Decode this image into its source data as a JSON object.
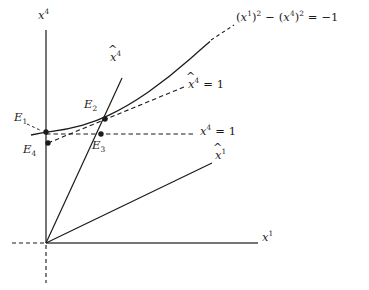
{
  "figure": {
    "type": "minkowski-spacetime-diagram",
    "background": "#ffffff",
    "ink_color": "#1b1b1b",
    "width": 369,
    "height": 290
  },
  "axes": {
    "vertical_label": "x",
    "vertical_superscript": "4",
    "horizontal_label": "x",
    "horizontal_superscript": "1",
    "origin": {
      "x": 46,
      "y": 243
    },
    "vertical_axis": {
      "x": 46,
      "y_top": 30,
      "y_bottom": 243
    },
    "horizontal_axis": {
      "y": 243,
      "x_left": 46,
      "x_right": 258
    },
    "dashed_extension_left": {
      "from_x": 12,
      "to_x": 46,
      "y": 243
    },
    "dashed_extension_down": {
      "x": 46,
      "from_y": 243,
      "to_y": 283
    }
  },
  "boosted_axes": {
    "x4_hat": {
      "label_base": "x",
      "label_superscript": "4",
      "label_accent": "hat",
      "line_from": {
        "x": 46,
        "y": 243
      },
      "line_to": {
        "x": 122,
        "y": 78
      }
    },
    "x1_hat": {
      "label_base": "x",
      "label_superscript": "1",
      "label_accent": "hat",
      "line_from": {
        "x": 46,
        "y": 243
      },
      "line_to": {
        "x": 212,
        "y": 163
      }
    }
  },
  "curve": {
    "name": "hyperbola",
    "equation_text": "(x1)2 - (x4)2 = -1",
    "equation_parts": {
      "open": "(",
      "base1": "x",
      "sup1": "1",
      "close_sq1": ")",
      "pow1": "2",
      "minus": "−",
      "open2": "(",
      "base2": "x",
      "sup2": "4",
      "close_sq2": ")",
      "pow2": "2",
      "equals": "=",
      "rhs": "−1"
    },
    "style": "solid"
  },
  "lines": {
    "x4_equals_1": {
      "label_base": "x",
      "label_superscript": "4",
      "label_rest": "= 1",
      "style": "dashed",
      "y": 134,
      "x_from": 46,
      "x_to": 196
    },
    "x4_hat_equals_1": {
      "label_base": "x",
      "label_superscript": "4",
      "label_accent": "hat",
      "label_rest": "= 1",
      "style": "dashed",
      "from": {
        "x": 48,
        "y": 143
      },
      "to": {
        "x": 184,
        "y": 87
      }
    },
    "leader_to_equation": {
      "style": "dashed",
      "from": {
        "x": 210,
        "y": 43
      },
      "to": {
        "x": 236,
        "y": 27
      }
    }
  },
  "events": [
    {
      "id": "E1",
      "base": "E",
      "sub": "1",
      "point": {
        "x": 46,
        "y": 132
      },
      "label_at": {
        "x": 14,
        "y": 112
      }
    },
    {
      "id": "E2",
      "base": "E",
      "sub": "2",
      "point": {
        "x": 105,
        "y": 119
      },
      "label_at": {
        "x": 84,
        "y": 99
      }
    },
    {
      "id": "E3",
      "base": "E",
      "sub": "3",
      "point": {
        "x": 101,
        "y": 134
      },
      "label_at": {
        "x": 92,
        "y": 140
      }
    },
    {
      "id": "E4",
      "base": "E",
      "sub": "4",
      "point": {
        "x": 48,
        "y": 143
      },
      "label_at": {
        "x": 23,
        "y": 144
      }
    }
  ],
  "labels": {
    "equation_at": {
      "x": 236,
      "y": 12
    },
    "x4_axis_at": {
      "x": 38,
      "y": 10
    },
    "x1_axis_at": {
      "x": 262,
      "y": 232
    },
    "x4_hat_at": {
      "x": 110,
      "y": 52
    },
    "x1_hat_at": {
      "x": 215,
      "y": 150
    },
    "x4_eq1_at": {
      "x": 200,
      "y": 126
    },
    "x4_hat_eq1_at": {
      "x": 188,
      "y": 79
    }
  }
}
